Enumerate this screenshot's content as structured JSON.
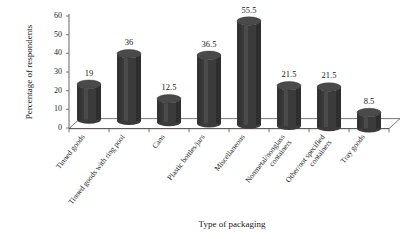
{
  "chart_data": {
    "type": "bar",
    "title": "",
    "subtitle": "",
    "xlabel": "Type of packaging",
    "ylabel": "Percentage of respondents",
    "categories": [
      "Tinned goods",
      "Tinned goods with ring pool",
      "Cans",
      "Plastic bottles/jars",
      "Miscellaneous",
      "Nonmetal/nonglass containers",
      "Other/not specified containers",
      "Tray goods"
    ],
    "values": [
      19,
      36,
      12.5,
      36.5,
      55.5,
      21.5,
      21.5,
      8.5
    ],
    "value_labels": [
      "19",
      "36",
      "12.5",
      "36.5",
      "55.5",
      "21.5",
      "21.5",
      "8.5"
    ],
    "ylim": [
      0,
      60
    ],
    "yticks": [
      0,
      10,
      20,
      30,
      40,
      50,
      60
    ],
    "ytick_labels": [
      "0",
      "10",
      "20",
      "30",
      "40",
      "50",
      "60"
    ],
    "grid": false,
    "legend": "none",
    "style": "3d-cylinder",
    "bar_color": "#3b3b3b",
    "axis_color": "#555555",
    "background": "#ffffff"
  },
  "category_lines": [
    [
      "Tinned goods"
    ],
    [
      "Tinned goods with ring pool"
    ],
    [
      "Cans"
    ],
    [
      "Plastic bottles/jars"
    ],
    [
      "Miscellaneous"
    ],
    [
      "Nonmetal/nonglass",
      "containers"
    ],
    [
      "Other/not specified",
      "containers"
    ],
    [
      "Tray goods"
    ]
  ]
}
